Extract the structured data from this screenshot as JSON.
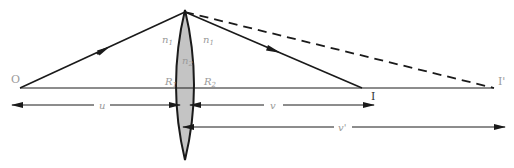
{
  "figure": {
    "type": "thin-lens-ray-diagram",
    "colors": {
      "line": "#1a1a1a",
      "lens_fill": "#c4c4c4",
      "label": "#9a9a9a"
    },
    "points": {
      "object": {
        "label": "O",
        "x": 20,
        "y": 88
      },
      "image": {
        "label": "I",
        "x": 362,
        "y": 88
      },
      "virtual_image": {
        "label": "I'",
        "x": 494,
        "y": 88
      },
      "lens_top": {
        "x": 185,
        "y": 12
      }
    },
    "lens": {
      "medium_left": {
        "label": "n",
        "sub": "1"
      },
      "medium_right": {
        "label": "n",
        "sub": "1"
      },
      "lens_medium": {
        "label": "n",
        "sub": "2"
      },
      "radius_left": {
        "label": "R",
        "sub": "1"
      },
      "radius_right": {
        "label": "R",
        "sub": "2"
      }
    },
    "distances": {
      "u": {
        "label": "u"
      },
      "v": {
        "label": "v"
      },
      "v_prime": {
        "label": "v'"
      }
    }
  }
}
